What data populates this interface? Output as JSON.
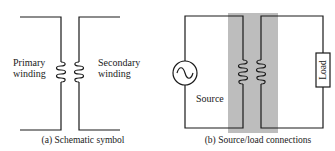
{
  "diagram_a": {
    "caption": "(a) Schematic symbol",
    "primary_label_line1": "Primary",
    "primary_label_line2": "winding",
    "secondary_label_line1": "Secondary",
    "secondary_label_line2": "winding"
  },
  "diagram_b": {
    "caption": "(b) Source/load connections",
    "source_label": "Source",
    "load_label": "Load",
    "core_shade_color": "#bdbdbd"
  },
  "colors": {
    "line": "#1a1a1a",
    "background": "#ffffff"
  }
}
